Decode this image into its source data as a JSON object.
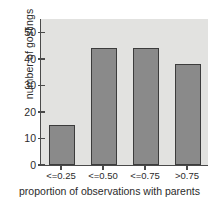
{
  "chart_data": {
    "type": "bar",
    "title": "",
    "subtitle": "",
    "xlabel": "proportion of observations with parents",
    "ylabel": "number of goslings",
    "categories": [
      "<=0.25",
      "<=0.50",
      "<=0.75",
      ">0.75"
    ],
    "values": [
      15,
      44,
      44,
      38
    ],
    "series": [
      {
        "name": "number of goslings",
        "values": [
          15,
          44,
          44,
          38
        ]
      }
    ],
    "ylim": [
      0,
      55
    ],
    "yticks": [
      0,
      10,
      20,
      30,
      40,
      50
    ],
    "ytick_labels": [
      "0",
      "10",
      "20",
      "30",
      "40",
      "50"
    ],
    "xtick_labels": [
      "<=0.25",
      "<=0.50",
      "<=0.75",
      ">0.75"
    ],
    "grid": false,
    "legend": null,
    "legend_position": "none",
    "annotations": [],
    "colors": {
      "bar_fill": "#8a8a8a",
      "bar_edge": "#3c3c3c",
      "plot_background": "#e2e2e0",
      "figure_background": "#ffffff",
      "axis": "#4a4a4a",
      "text": "#2b2b2b"
    }
  }
}
